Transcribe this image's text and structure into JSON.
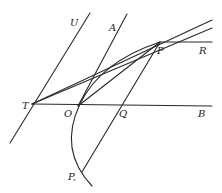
{
  "figure": {
    "type": "geometric diagram",
    "labels": {
      "U": "U",
      "A": "A",
      "P": "P",
      "R": "R",
      "T": "T",
      "O": "O",
      "Q": "Q",
      "B": "B",
      "P1": "P,"
    },
    "points": {
      "T": [
        32,
        104
      ],
      "O": [
        78,
        106
      ],
      "Q": [
        124,
        106
      ],
      "P": [
        160,
        42
      ],
      "P1": [
        82,
        170
      ]
    },
    "colors": {
      "line": "#2a2a2a",
      "background": "#ffffff"
    }
  }
}
